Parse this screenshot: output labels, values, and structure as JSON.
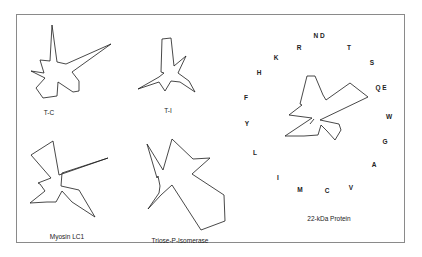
{
  "figure": {
    "panels": [
      {
        "name": "T-C",
        "label": "T-C"
      },
      {
        "name": "T-I",
        "label": "T-I"
      },
      {
        "name": "Myosin LC1",
        "label": "Myosin LC1"
      },
      {
        "name": "Triose-P-Isomerase",
        "label": "Triose-P-Isomerase"
      },
      {
        "name": "22-kDa Protein",
        "label": "22-kDa Protein"
      }
    ],
    "amino_acid_axes": [
      "N D",
      "R",
      "T",
      "K",
      "S",
      "H",
      "Q E",
      "F",
      "W",
      "Y",
      "G",
      "L",
      "A",
      "I",
      "M",
      "C",
      "V"
    ],
    "line_color": "#1a1a1a",
    "frame_color": "#8a8a8a"
  }
}
